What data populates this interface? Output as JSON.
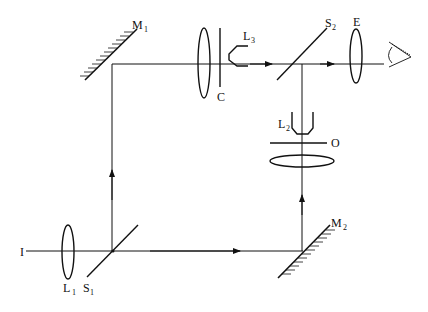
{
  "diagram": {
    "type": "optical-setup",
    "colors": {
      "line": "#111111",
      "background": "#ffffff"
    },
    "labels": {
      "source": {
        "main": "I",
        "sub": ""
      },
      "lens1": {
        "main": "L",
        "sub": "1"
      },
      "splitter1": {
        "main": "S",
        "sub": "1"
      },
      "mirror1": {
        "main": "M",
        "sub": "1"
      },
      "mirror2": {
        "main": "M",
        "sub": "2"
      },
      "lens3": {
        "main": "L",
        "sub": "3"
      },
      "compensator": {
        "main": "C",
        "sub": ""
      },
      "splitter2": {
        "main": "S",
        "sub": "2"
      },
      "eyepiece": {
        "main": "E",
        "sub": ""
      },
      "lens2": {
        "main": "L",
        "sub": "2"
      },
      "object": {
        "main": "O",
        "sub": ""
      }
    },
    "components": [
      "source-I",
      "lens-L1",
      "beam-splitter-S1",
      "mirror-M1",
      "mirror-M2",
      "lens",
      "compensator-C",
      "objective-L3",
      "beam-splitter-S2",
      "eyepiece-E",
      "eye",
      "objective-L2",
      "object-O",
      "condenser-lens"
    ]
  }
}
